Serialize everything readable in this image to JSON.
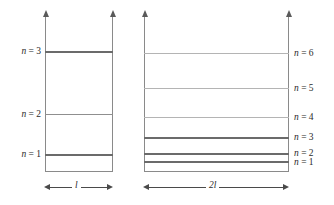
{
  "figure": {
    "background_color": "#ffffff"
  },
  "chart_data": {
    "type": "diagram",
    "xlabel": "",
    "ylabel": "",
    "grid": false,
    "legend": false,
    "panels": [
      {
        "id": "left-well",
        "width_label": "l",
        "axis_arrows": 2,
        "levels": [
          {
            "n": 1,
            "label": "n = 1",
            "relative_energy": 1,
            "y_px": 155,
            "weight": "dark"
          },
          {
            "n": 2,
            "label": "n = 2",
            "relative_energy": 4,
            "y_px": 114,
            "weight": "mid"
          },
          {
            "n": 3,
            "label": "n = 3",
            "relative_energy": 9,
            "y_px": 52,
            "weight": "dark"
          }
        ],
        "label_side": "left"
      },
      {
        "id": "right-well",
        "width_label": "2l",
        "axis_arrows": 2,
        "levels": [
          {
            "n": 1,
            "label": "n = 1",
            "relative_energy": 0.25,
            "y_px": 162,
            "weight": "dark"
          },
          {
            "n": 2,
            "label": "n = 2",
            "relative_energy": 1,
            "y_px": 154,
            "weight": "dark"
          },
          {
            "n": 3,
            "label": "n = 3",
            "relative_energy": 2.25,
            "y_px": 138,
            "weight": "dark"
          },
          {
            "n": 4,
            "label": "n = 4",
            "relative_energy": 4,
            "y_px": 117,
            "weight": "light"
          },
          {
            "n": 5,
            "label": "n = 5",
            "relative_energy": 6.25,
            "y_px": 88,
            "weight": "light"
          },
          {
            "n": 6,
            "label": "n = 6",
            "relative_energy": 9,
            "y_px": 53,
            "weight": "light"
          }
        ],
        "label_side": "right"
      }
    ],
    "colors": {
      "wall": "#8a8a8a",
      "level_dark": "#6b6b6b",
      "level_mid": "#8f8f8f",
      "level_light": "#b4b4b4",
      "text": "#2b2b2b",
      "dimension": "#4a4a4a"
    }
  },
  "left_well": {
    "dimension_label": "l",
    "levels": [
      {
        "label": "n = 3"
      },
      {
        "label": "n = 2"
      },
      {
        "label": "n = 1"
      }
    ]
  },
  "right_well": {
    "dimension_label": "2l",
    "levels": [
      {
        "label": "n = 6"
      },
      {
        "label": "n = 5"
      },
      {
        "label": "n = 4"
      },
      {
        "label": "n = 3"
      },
      {
        "label": "n = 2"
      },
      {
        "label": "n = 1"
      }
    ]
  }
}
